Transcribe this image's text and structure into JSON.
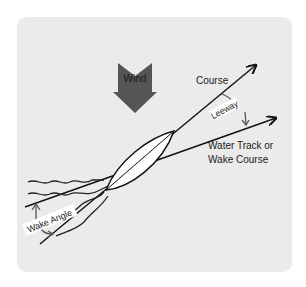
{
  "diagram": {
    "labels": {
      "wind": "Wind",
      "course": "Course",
      "leeway": "Leeway",
      "water_track_line1": "Water Track or",
      "water_track_line2": "Wake Course",
      "wake_angle": "Wake Angle"
    },
    "colors": {
      "panel_background": "#ebebeb",
      "wind_arrow": "#555555",
      "lines": "#111111",
      "hull": "#ffffff",
      "label_background": "#ffffff",
      "annotation_arrow": "#555555"
    }
  }
}
